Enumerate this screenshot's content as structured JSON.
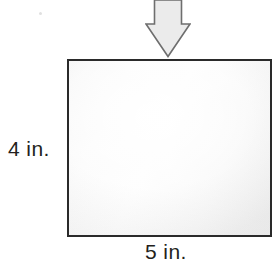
{
  "figure": {
    "type": "geometry-diagram",
    "background_color": "#ffffff"
  },
  "arrow": {
    "name": "down-arrow-icon",
    "direction": "down",
    "fill_color": "#ebebeb",
    "stroke_color": "#6e6e6e"
  },
  "rectangle": {
    "name": "rectangle-shape",
    "fill_color": "#f7f7f7",
    "stroke_color": "#2a2a2a"
  },
  "labels": {
    "height": "4 in.",
    "width": "5 in."
  },
  "artifacts": {
    "speck": ""
  }
}
